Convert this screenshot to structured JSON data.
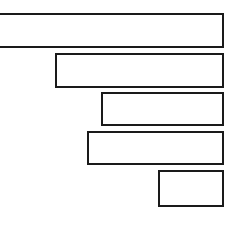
{
  "chart": {
    "title": "",
    "subtitle": "",
    "xlabel": "",
    "ylabel": "",
    "background_color": "#ffffff",
    "bar_fill_color": "#ffffff",
    "bar_outline_color": "#1a1a1a",
    "bar_outline_width_px": 2
  },
  "chart_data": {
    "type": "bar",
    "orientation": "horizontal",
    "title": "",
    "subtitle": "",
    "xlabel": "",
    "ylabel": "",
    "grid": false,
    "legend": false,
    "legend_position": "none",
    "axis_visible": false,
    "tick_labels_visible": false,
    "data_labels_visible": false,
    "note": "Unlabeled horizontal bar chart. Bars are right-aligned to a common baseline at the right side; length encodes value. The top (largest) bar is clipped by the left edge of the image.",
    "categories": [
      "1",
      "2",
      "3",
      "4",
      "5"
    ],
    "values": [
      236,
      169,
      123,
      137,
      66
    ],
    "xlim": [
      0,
      236
    ],
    "bars": [
      {
        "category": "1",
        "value": 236,
        "left_px": -4,
        "right_px": 224,
        "top_px": 13,
        "bottom_px": 48,
        "length_px": 228,
        "clipped_left": true
      },
      {
        "category": "2",
        "value": 169,
        "left_px": 55,
        "right_px": 224,
        "top_px": 53,
        "bottom_px": 88,
        "length_px": 169,
        "clipped_left": false
      },
      {
        "category": "3",
        "value": 123,
        "left_px": 101,
        "right_px": 224,
        "top_px": 92,
        "bottom_px": 126,
        "length_px": 123,
        "clipped_left": false
      },
      {
        "category": "4",
        "value": 137,
        "left_px": 87,
        "right_px": 224,
        "top_px": 131,
        "bottom_px": 165,
        "length_px": 137,
        "clipped_left": false
      },
      {
        "category": "5",
        "value": 66,
        "left_px": 158,
        "right_px": 224,
        "top_px": 170,
        "bottom_px": 207,
        "length_px": 66,
        "clipped_left": false
      }
    ]
  }
}
